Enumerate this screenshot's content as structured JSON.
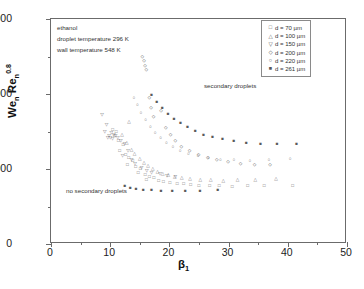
{
  "chart_data": {
    "type": "scatter",
    "title": "",
    "xlabel": "β₁",
    "ylabel": "Weₙ Reₙ^0.8",
    "xlim": [
      0,
      50
    ],
    "ylim": [
      0,
      6000
    ],
    "xticks": [
      0,
      10,
      20,
      30,
      40,
      50
    ],
    "yticks": [
      0,
      2000,
      4000,
      6000
    ],
    "grid": false,
    "legend_position": "top-right",
    "conditions": [
      "ethanol",
      "droplet temperature  296 K",
      "wall temperature  548 K"
    ],
    "annotations": [
      {
        "text": "secondary droplets",
        "x": 26,
        "y": 3450
      },
      {
        "text": "no secondary droplets",
        "x": 5.5,
        "y": 800
      }
    ],
    "legend": [
      {
        "label": "d = 70 µm",
        "marker": "square"
      },
      {
        "label": "d = 100 µm",
        "marker": "triangle-up"
      },
      {
        "label": "d = 150 µm",
        "marker": "triangle-down"
      },
      {
        "label": "d = 200 µm",
        "marker": "diamond"
      },
      {
        "label": "d = 220 µm",
        "marker": "circle"
      },
      {
        "label": "d = 261 µm",
        "marker": "square-filled"
      }
    ],
    "series": [
      {
        "name": "d = 70 µm",
        "marker": "square",
        "points": [
          [
            10.4,
            3050
          ],
          [
            11.0,
            2980
          ],
          [
            10.7,
            2870
          ],
          [
            11.4,
            2760
          ],
          [
            12.2,
            2640
          ],
          [
            11.6,
            2480
          ],
          [
            12.6,
            2380
          ],
          [
            13.1,
            2300
          ],
          [
            13.8,
            2210
          ],
          [
            12.9,
            2120
          ],
          [
            14.3,
            2050
          ],
          [
            15.1,
            1990
          ],
          [
            14.7,
            1900
          ],
          [
            15.9,
            1840
          ],
          [
            16.6,
            1790
          ],
          [
            17.4,
            1760
          ],
          [
            16.1,
            1700
          ],
          [
            18.2,
            1680
          ],
          [
            19.0,
            1650
          ],
          [
            20.1,
            1630
          ],
          [
            21.3,
            1600
          ],
          [
            22.4,
            1590
          ],
          [
            23.6,
            1570
          ],
          [
            25.0,
            1560
          ],
          [
            26.8,
            1550
          ],
          [
            28.4,
            1540
          ],
          [
            30.6,
            1530
          ],
          [
            33.2,
            1540
          ],
          [
            36.0,
            1550
          ],
          [
            40.8,
            1560
          ]
        ]
      },
      {
        "name": "d = 100 µm",
        "marker": "triangle-up",
        "points": [
          [
            13.2,
            3250
          ],
          [
            12.0,
            2900
          ],
          [
            12.8,
            2700
          ],
          [
            13.6,
            2520
          ],
          [
            14.1,
            2400
          ],
          [
            15.0,
            2280
          ],
          [
            15.7,
            2170
          ],
          [
            16.4,
            2080
          ],
          [
            17.2,
            2000
          ],
          [
            18.0,
            1930
          ],
          [
            18.9,
            1880
          ],
          [
            19.8,
            1830
          ],
          [
            20.9,
            1790
          ],
          [
            22.1,
            1760
          ],
          [
            23.5,
            1730
          ],
          [
            25.2,
            1710
          ],
          [
            27.0,
            1700
          ],
          [
            29.1,
            1690
          ],
          [
            31.5,
            1700
          ],
          [
            34.5,
            1710
          ],
          [
            38.0,
            1730
          ]
        ]
      },
      {
        "name": "d = 150 µm",
        "marker": "triangle-down",
        "points": [
          [
            8.6,
            3450
          ],
          [
            9.4,
            3180
          ],
          [
            9.1,
            3000
          ],
          [
            9.8,
            2880
          ],
          [
            10.2,
            2960
          ],
          [
            10.6,
            2900
          ],
          [
            10.9,
            2870
          ],
          [
            11.3,
            2840
          ],
          [
            9.6,
            2830
          ],
          [
            10.0,
            2820
          ],
          [
            10.4,
            2810
          ],
          [
            11.8,
            2760
          ],
          [
            12.4,
            2660
          ],
          [
            13.0,
            2480
          ],
          [
            12.1,
            2350
          ],
          [
            13.6,
            2240
          ],
          [
            14.2,
            2130
          ],
          [
            15.3,
            2030
          ],
          [
            16.2,
            1950
          ],
          [
            17.0,
            1900
          ],
          [
            18.4,
            1860
          ],
          [
            19.6,
            1820
          ],
          [
            21.0,
            1790
          ]
        ]
      },
      {
        "name": "d = 200 µm",
        "marker": "diamond",
        "points": [
          [
            15.4,
            5000
          ],
          [
            15.7,
            4880
          ],
          [
            15.9,
            4760
          ],
          [
            16.1,
            4640
          ],
          [
            16.6,
            3900
          ],
          [
            16.9,
            3620
          ],
          [
            17.3,
            3400
          ],
          [
            18.6,
            3540
          ],
          [
            19.4,
            3100
          ],
          [
            20.2,
            2900
          ],
          [
            21.0,
            2760
          ],
          [
            22.0,
            2600
          ],
          [
            23.4,
            2480
          ],
          [
            24.9,
            2380
          ],
          [
            26.5,
            2300
          ],
          [
            28.0,
            2230
          ],
          [
            29.9,
            2180
          ],
          [
            32.0,
            2140
          ],
          [
            34.4,
            2120
          ],
          [
            37.0,
            2100
          ]
        ]
      },
      {
        "name": "d = 220 µm",
        "marker": "circle",
        "points": [
          [
            14.0,
            3900
          ],
          [
            14.6,
            3700
          ],
          [
            15.2,
            3500
          ],
          [
            16.0,
            3300
          ],
          [
            16.8,
            3120
          ],
          [
            17.6,
            2960
          ],
          [
            18.5,
            2820
          ],
          [
            19.5,
            2700
          ],
          [
            20.6,
            2590
          ],
          [
            21.8,
            2490
          ],
          [
            23.2,
            2410
          ],
          [
            24.8,
            2340
          ],
          [
            26.6,
            2290
          ],
          [
            28.6,
            2250
          ],
          [
            30.9,
            2230
          ],
          [
            33.6,
            2220
          ],
          [
            36.8,
            2230
          ],
          [
            40.4,
            2260
          ]
        ]
      },
      {
        "name": "d = 261 µm",
        "marker": "square-filled",
        "points": [
          [
            17.0,
            3980
          ],
          [
            17.9,
            3800
          ],
          [
            18.8,
            3640
          ],
          [
            19.8,
            3480
          ],
          [
            20.8,
            3340
          ],
          [
            21.9,
            3220
          ],
          [
            23.1,
            3110
          ],
          [
            24.4,
            3010
          ],
          [
            25.8,
            2920
          ],
          [
            27.3,
            2850
          ],
          [
            29.0,
            2790
          ],
          [
            30.9,
            2740
          ],
          [
            33.0,
            2700
          ],
          [
            35.4,
            2680
          ],
          [
            38.2,
            2670
          ],
          [
            41.5,
            2680
          ],
          [
            12.5,
            1540
          ],
          [
            13.4,
            1500
          ],
          [
            14.4,
            1470
          ],
          [
            15.6,
            1450
          ],
          [
            17.0,
            1430
          ],
          [
            18.6,
            1420
          ],
          [
            20.5,
            1410
          ],
          [
            22.7,
            1410
          ],
          [
            25.2,
            1420
          ],
          [
            28.2,
            1430
          ]
        ]
      }
    ]
  }
}
